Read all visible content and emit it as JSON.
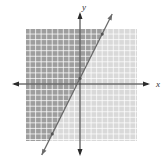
{
  "chart_data": {
    "type": "line",
    "title": "",
    "subtitle": "",
    "xlabel": "x",
    "ylabel": "y",
    "xlim": [
      -10,
      10
    ],
    "ylim": [
      -10,
      10
    ],
    "grid": true,
    "tick_labels_visible": false,
    "legend": null,
    "series": [
      {
        "name": "boundary line",
        "equation": "y = 2x + 1",
        "slope": 2,
        "intercept": 1,
        "style": "solid",
        "arrows": "both",
        "x": [
          -5,
          0,
          4
        ],
        "y": [
          -9,
          1,
          9
        ],
        "marked_points": [
          [
            -5,
            -9
          ],
          [
            0,
            1
          ],
          [
            4,
            9
          ]
        ]
      }
    ],
    "shaded_region": {
      "inequality": "y > 2x + 1",
      "side": "above-left of line",
      "shade_color": "#9a9a9a"
    },
    "unshaded_color": "#d6d6d6"
  },
  "colors": {
    "dark_region": "#9e9e9e",
    "light_region": "#d9d9d9",
    "grid_line": "#ffffff",
    "axis": "#2b2b2b",
    "line": "#6a6a6a"
  }
}
